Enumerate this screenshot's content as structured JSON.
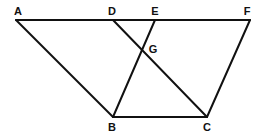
{
  "diagram": {
    "points": {
      "A": {
        "label": "A",
        "x": 16,
        "y": 20,
        "lx": 18,
        "ly": 12
      },
      "D": {
        "label": "D",
        "x": 113,
        "y": 20,
        "lx": 112,
        "ly": 12
      },
      "E": {
        "label": "E",
        "x": 155,
        "y": 20,
        "lx": 155,
        "ly": 12
      },
      "F": {
        "label": "F",
        "x": 250,
        "y": 20,
        "lx": 247,
        "ly": 12
      },
      "G": {
        "label": "G",
        "x": 143,
        "y": 50,
        "lx": 153,
        "ly": 50
      },
      "B": {
        "label": "B",
        "x": 113,
        "y": 117,
        "lx": 112,
        "ly": 128
      },
      "C": {
        "label": "C",
        "x": 207,
        "y": 117,
        "lx": 207,
        "ly": 128
      }
    },
    "segments": [
      {
        "from": "A",
        "to": "F"
      },
      {
        "from": "A",
        "to": "B"
      },
      {
        "from": "B",
        "to": "C"
      },
      {
        "from": "C",
        "to": "F"
      },
      {
        "from": "D",
        "to": "C"
      },
      {
        "from": "E",
        "to": "B"
      }
    ],
    "line_color": "#111111"
  }
}
